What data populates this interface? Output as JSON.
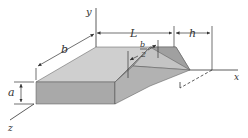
{
  "figure": {
    "labels": {
      "y_axis": "y",
      "x_axis": "x",
      "z_axis": "z",
      "b": "b",
      "L": "L",
      "h": "h",
      "a": "a",
      "half_b_num": "b",
      "half_b_den": "2"
    },
    "colors": {
      "line": "#333333",
      "top_face": "#cfcfcf",
      "front_face": "#a9a9a9",
      "side_face": "#9a9a9a",
      "wedge_top": "#c4c4c4",
      "wedge_side": "#b2b2b2"
    }
  }
}
